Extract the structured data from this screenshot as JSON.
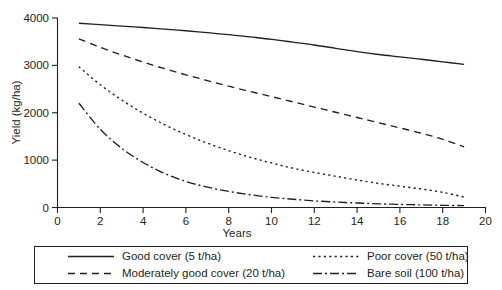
{
  "chart_data": {
    "type": "line",
    "title": "",
    "xlabel": "Years",
    "ylabel": "Yield (kg/ha)",
    "xlim": [
      0,
      20
    ],
    "ylim": [
      0,
      4000
    ],
    "xticks": [
      0,
      2,
      4,
      6,
      8,
      10,
      12,
      14,
      16,
      18,
      20
    ],
    "xtick_labels": [
      "0",
      "2",
      "4",
      "6",
      "8",
      "10",
      "12",
      "14",
      "16",
      "18",
      "20"
    ],
    "yticks": [
      0,
      1000,
      2000,
      3000,
      4000
    ],
    "ytick_labels": [
      "0",
      "1000",
      "2000",
      "3000",
      "4000"
    ],
    "grid": false,
    "legend_position": "below-plot",
    "x": [
      1,
      2,
      3,
      4,
      5,
      6,
      7,
      8,
      9,
      10,
      11,
      12,
      13,
      14,
      15,
      16,
      17,
      18,
      19
    ],
    "series": [
      {
        "name": "Good cover (5 t/ha)",
        "style": "solid",
        "dasharray": "none",
        "color": "#231f20",
        "values": [
          3890,
          3860,
          3830,
          3800,
          3765,
          3730,
          3690,
          3650,
          3600,
          3550,
          3490,
          3430,
          3360,
          3290,
          3230,
          3180,
          3130,
          3075,
          3020
        ]
      },
      {
        "name": "Moderately good cover (20 t/ha)",
        "style": "dashed",
        "dasharray": "7,5",
        "color": "#231f20",
        "values": [
          3560,
          3380,
          3220,
          3070,
          2930,
          2800,
          2680,
          2560,
          2450,
          2340,
          2230,
          2120,
          2010,
          1900,
          1790,
          1680,
          1570,
          1440,
          1280
        ]
      },
      {
        "name": "Poor cover (50 t/ha)",
        "style": "dotted",
        "dasharray": "2.2,3.2",
        "color": "#231f20",
        "values": [
          2970,
          2590,
          2270,
          1990,
          1750,
          1540,
          1360,
          1200,
          1060,
          940,
          830,
          740,
          660,
          580,
          510,
          450,
          390,
          320,
          220
        ]
      },
      {
        "name": "Bare soil (100 t/ha)",
        "style": "dashdot",
        "dasharray": "9,3,2,3",
        "color": "#231f20",
        "values": [
          2200,
          1650,
          1250,
          950,
          720,
          550,
          430,
          340,
          270,
          215,
          175,
          140,
          115,
          95,
          78,
          65,
          55,
          46,
          40
        ]
      }
    ]
  },
  "legend": {
    "items": [
      {
        "label": "Good cover (5 t/ha)",
        "style": "solid"
      },
      {
        "label": "Poor cover (50 t/ha)",
        "style": "dotted"
      },
      {
        "label": "Moderately good cover (20 t/ha)",
        "style": "dashed"
      },
      {
        "label": "Bare soil (100 t/ha)",
        "style": "dashdot"
      }
    ]
  },
  "colors": {
    "ink": "#231f20",
    "background": "#ffffff"
  }
}
